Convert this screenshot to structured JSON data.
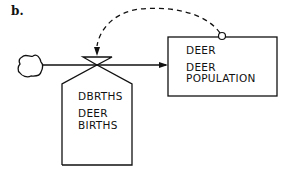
{
  "panel_label": "b.",
  "level": {
    "code": "DEER",
    "name_line1": "DEER",
    "name_line2": "POPULATION"
  },
  "rate": {
    "code": "DBRTHS",
    "name_line1": "DEER",
    "name_line2": "BIRTHS"
  },
  "source": "cloud",
  "colors": {
    "ink": "#111111",
    "background": "#ffffff"
  }
}
